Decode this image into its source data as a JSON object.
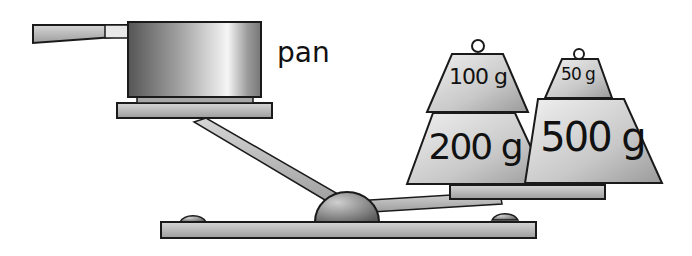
{
  "diagram": {
    "type": "balance-scale-illustration",
    "left_pan": {
      "object": "pan",
      "label": "pan"
    },
    "right_pan": {
      "weights": [
        {
          "label": "100 g",
          "position": "left-top"
        },
        {
          "label": "200 g",
          "position": "left-bottom"
        },
        {
          "label": "50 g",
          "position": "right-top"
        },
        {
          "label": "500 g",
          "position": "right-bottom"
        }
      ]
    },
    "colors": {
      "metal_light": "#e6e6e6",
      "metal_mid": "#b5b5b5",
      "metal_dark": "#6e6e6e",
      "outline": "#1a1a1a"
    }
  }
}
